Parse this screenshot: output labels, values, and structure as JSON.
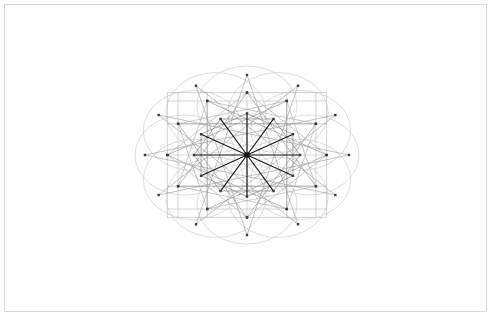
{
  "document": {
    "title": "Twelve-Fold Star Polygon and Circle Rosette",
    "background_color": "#ffffff",
    "width": 493,
    "height": 317
  },
  "frame": {
    "name": "plot-frame",
    "x": 4,
    "y": 4,
    "width": 483,
    "height": 308,
    "stroke_color": "#d8d8d8",
    "stroke_width": 1
  },
  "figure": {
    "center": {
      "x": 247,
      "y": 155
    },
    "symmetry_order": 12,
    "radius_x": 102,
    "radius_y": 80,
    "vertex_marker": {
      "shape": "square",
      "size": 2.4,
      "color": "#3a3a3a"
    },
    "colors": {
      "circle_ring": "#cfcfcf",
      "circle_inner": "#d6d6d6",
      "star_outer": "#9a9a9a",
      "star_mid": "#8a8a8a",
      "star_inner": "#7a7a7a",
      "grid": "#a8a8a8",
      "spoke": "#1c1c1c",
      "hub": "#141414"
    },
    "layers": [
      {
        "name": "circle-rosette",
        "type": "circles",
        "count": 12,
        "ring_radius_x": 62,
        "ring_radius_y": 49,
        "circle_radius_x": 50,
        "circle_radius_y": 40,
        "stroke_width": 0.7,
        "color": "#cfcfcf"
      },
      {
        "name": "center-circle",
        "type": "circle",
        "circle_radius_x": 50,
        "circle_radius_y": 40,
        "stroke_width": 0.7,
        "color": "#d6d6d6"
      },
      {
        "name": "star-polygon-12-5",
        "type": "star-polygon",
        "points": 12,
        "step": 5,
        "radius_scale": 1.0,
        "rotation_deg": 0,
        "stroke_width": 0.6,
        "color": "#9a9a9a"
      },
      {
        "name": "star-polygon-12-4",
        "type": "star-polygon",
        "points": 12,
        "step": 4,
        "radius_scale": 0.78,
        "rotation_deg": 0,
        "stroke_width": 0.6,
        "color": "#8a8a8a"
      },
      {
        "name": "star-polygon-12-3-grid",
        "type": "star-polygon",
        "points": 12,
        "step": 3,
        "radius_scale": 0.78,
        "rotation_deg": 0,
        "stroke_width": 0.6,
        "color": "#a8a8a8"
      },
      {
        "name": "star-polygon-12-2",
        "type": "star-polygon",
        "points": 12,
        "step": 2,
        "radius_scale": 0.52,
        "rotation_deg": 0,
        "stroke_width": 0.6,
        "color": "#7a7a7a"
      },
      {
        "name": "radial-spokes",
        "type": "spokes",
        "count": 12,
        "radius_scale": 0.52,
        "stroke_width": 1.2,
        "color": "#1c1c1c"
      }
    ]
  },
  "labels": {
    "alt_text": "Geometric line drawing: twelve-point star polygons overlaid on a ring of twelve pale circles, with twelve dark radial spokes converging at the centre."
  }
}
